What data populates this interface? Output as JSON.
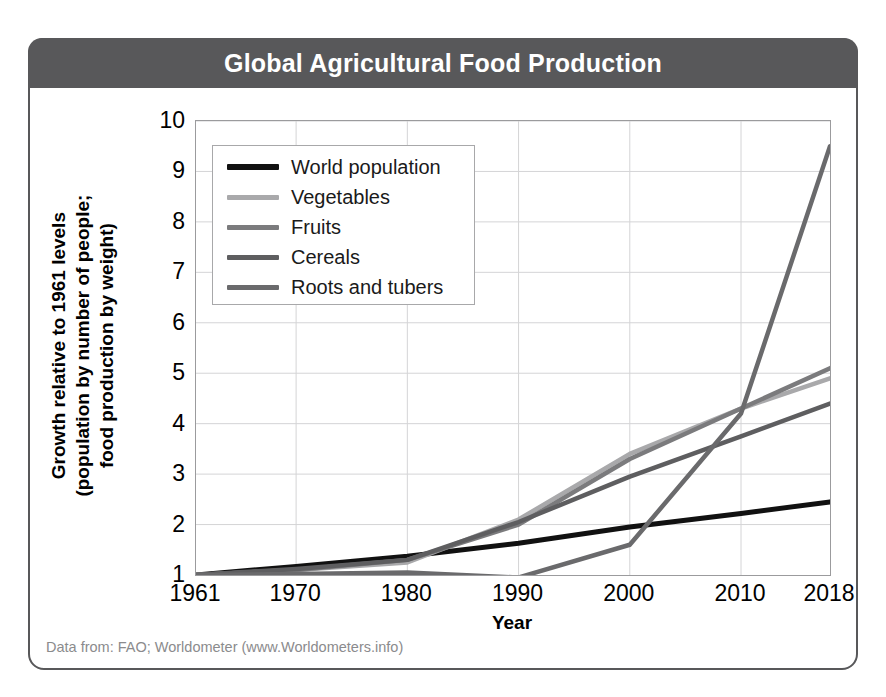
{
  "card": {
    "title": "Global Agricultural Food Production",
    "footnote": "Data from: FAO; Worldometer (www.Worldometers.info)"
  },
  "axes": {
    "ylabel_line1": "Growth relative to 1961 levels",
    "ylabel_line2": "(population by number of people;",
    "ylabel_line3": "food production by weight)",
    "xlabel": "Year"
  },
  "colors": {
    "header_bg": "#58585a",
    "card_border": "#58585a",
    "plot_border": "#9b9b9d",
    "gridline": "#d4d4d6",
    "world_population": "#111111",
    "vegetables": "#a9a9ab",
    "fruits": "#7b7b7d",
    "cereals": "#5e5e60",
    "roots_and_tubers": "#6a6a6c",
    "footnote_text": "#8b8b8d"
  },
  "chart_data": {
    "type": "line",
    "title": "Global Agricultural Food Production",
    "xlabel": "Year",
    "ylabel": "Growth relative to 1961 levels (population by number of people; food production by weight)",
    "x": [
      1961,
      1970,
      1980,
      1990,
      2000,
      2010,
      2018
    ],
    "xticklabels": [
      "1961",
      "1970",
      "1980",
      "1990",
      "2000",
      "2010",
      "2018"
    ],
    "yticklabels": [
      "1",
      "2",
      "3",
      "4",
      "5",
      "6",
      "7",
      "8",
      "9",
      "10"
    ],
    "xlim": [
      1961,
      2018
    ],
    "ylim": [
      1,
      10
    ],
    "grid": true,
    "legend_position": "upper-left-inside",
    "series": [
      {
        "name": "World population",
        "color": "#111111",
        "values": [
          1.0,
          1.17,
          1.37,
          1.63,
          1.95,
          2.22,
          2.45
        ]
      },
      {
        "name": "Vegetables",
        "color": "#a9a9ab",
        "values": [
          1.0,
          1.1,
          1.25,
          2.1,
          3.4,
          4.3,
          4.9
        ]
      },
      {
        "name": "Fruits",
        "color": "#7b7b7d",
        "values": [
          1.0,
          1.1,
          1.3,
          2.0,
          3.3,
          4.3,
          5.1
        ]
      },
      {
        "name": "Cereals",
        "color": "#5e5e60",
        "values": [
          1.0,
          1.12,
          1.3,
          2.05,
          2.95,
          3.75,
          4.4
        ]
      },
      {
        "name": "Roots and tubers",
        "color": "#6a6a6c",
        "values": [
          1.0,
          1.02,
          1.05,
          0.95,
          1.6,
          4.2,
          9.5
        ]
      }
    ]
  },
  "legend": {
    "items": [
      {
        "label": "World population",
        "color": "#111111",
        "thickness": 6
      },
      {
        "label": "Vegetables",
        "color": "#a9a9ab",
        "thickness": 5
      },
      {
        "label": "Fruits",
        "color": "#7b7b7d",
        "thickness": 5
      },
      {
        "label": "Cereals",
        "color": "#5e5e60",
        "thickness": 5
      },
      {
        "label": "Roots and tubers",
        "color": "#6a6a6c",
        "thickness": 5
      }
    ]
  }
}
